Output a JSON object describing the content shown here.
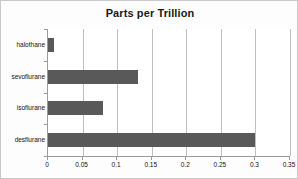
{
  "chart_data": {
    "type": "bar",
    "orientation": "horizontal",
    "title": "Parts per Trillion",
    "xlabel": "",
    "ylabel": "",
    "categories": [
      "halothane",
      "sevoflurane",
      "isoflurane",
      "desflurane"
    ],
    "values": [
      0.009,
      0.13,
      0.08,
      0.3
    ],
    "xlim": [
      0,
      0.35
    ],
    "xticks": [
      0,
      0.05,
      0.1,
      0.15,
      0.2,
      0.25,
      0.3,
      0.35
    ],
    "xtick_labels": [
      "0",
      "0.05",
      "0.1",
      "0.15",
      "0.2",
      "0.25",
      "0.3",
      "0.35"
    ],
    "grid": true,
    "grid_axis": "x",
    "legend": false,
    "series": [
      {
        "name": "Parts per Trillion",
        "color": "#595959",
        "values": [
          0.009,
          0.13,
          0.08,
          0.3
        ]
      }
    ],
    "colors": {
      "bar": "#595959",
      "gridline": "#bfbfbf",
      "axis": "#9a9a9a",
      "plot_background": "#ffffff",
      "frame_background": "#fdfdfd",
      "frame_border": "#c9c9c9",
      "text": "#111111",
      "title": "#1a1a1a"
    }
  }
}
